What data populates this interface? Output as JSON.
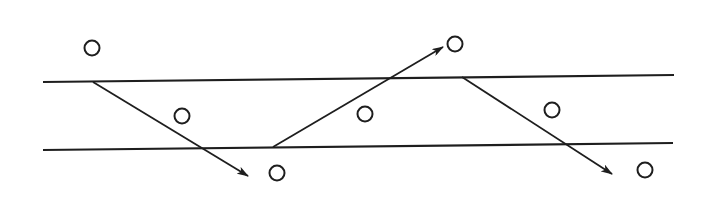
{
  "diagram": {
    "type": "zigzag-ray-between-parallel-boundaries",
    "colors": {
      "ink": "#1e1e1e",
      "background": "#ffffff"
    },
    "boundaries": [
      {
        "name": "upper-boundary",
        "x1": 43,
        "y1": 82,
        "x2": 674,
        "y2": 75
      },
      {
        "name": "lower-boundary",
        "x1": 43,
        "y1": 150,
        "x2": 673,
        "y2": 143
      }
    ],
    "rays": [
      {
        "name": "ray-1-down",
        "x1": 93,
        "y1": 82,
        "x2": 248,
        "y2": 176
      },
      {
        "name": "ray-2-up",
        "x1": 273,
        "y1": 147,
        "x2": 443,
        "y2": 47
      },
      {
        "name": "ray-3-down",
        "x1": 462,
        "y1": 77,
        "x2": 612,
        "y2": 174
      }
    ],
    "particles": [
      {
        "name": "particle-above-1",
        "cx": 92,
        "cy": 48,
        "r": 7.5
      },
      {
        "name": "particle-between-1",
        "cx": 182,
        "cy": 116,
        "r": 7.5
      },
      {
        "name": "particle-below-1",
        "cx": 277,
        "cy": 173,
        "r": 7.5
      },
      {
        "name": "particle-between-2",
        "cx": 365,
        "cy": 114,
        "r": 7.5
      },
      {
        "name": "particle-above-2",
        "cx": 455,
        "cy": 44,
        "r": 7.5
      },
      {
        "name": "particle-between-3",
        "cx": 552,
        "cy": 110,
        "r": 7.5
      },
      {
        "name": "particle-below-2",
        "cx": 645,
        "cy": 170,
        "r": 7.5
      }
    ]
  }
}
